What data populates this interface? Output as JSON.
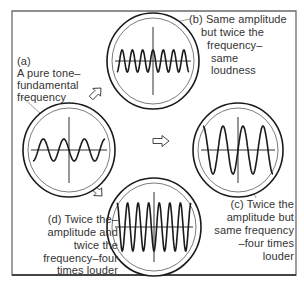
{
  "diagram": {
    "type": "sound-wave comparison",
    "panels": [
      {
        "id": "a",
        "tag": "(a)",
        "lines": [
          "A pure tone–",
          "fundamental",
          "frequency"
        ],
        "cycles": 3.5,
        "amplitude": "normal"
      },
      {
        "id": "b",
        "tag": "(b)",
        "lines": [
          "(b) Same amplitude",
          "but twice the",
          "frequency–",
          "same",
          "loudness"
        ],
        "cycles": 7,
        "amplitude": "normal"
      },
      {
        "id": "c",
        "tag": "(c)",
        "lines": [
          "(c) Twice the",
          "amplitude but",
          "same frequency",
          "–four times",
          "louder"
        ],
        "cycles": 3.5,
        "amplitude": "double"
      },
      {
        "id": "d",
        "tag": "(d)",
        "lines": [
          "(d) Twice the–",
          "amplitude and",
          "twice the",
          "frequency–four",
          "times louder"
        ],
        "cycles": 7,
        "amplitude": "double"
      }
    ],
    "arrows": [
      "arrow-a-to-b",
      "arrow-a-to-c",
      "arrow-a-to-d"
    ],
    "colors": {
      "ink": "#1a1a1a",
      "frame": "#555555",
      "background": "#ffffff"
    }
  }
}
